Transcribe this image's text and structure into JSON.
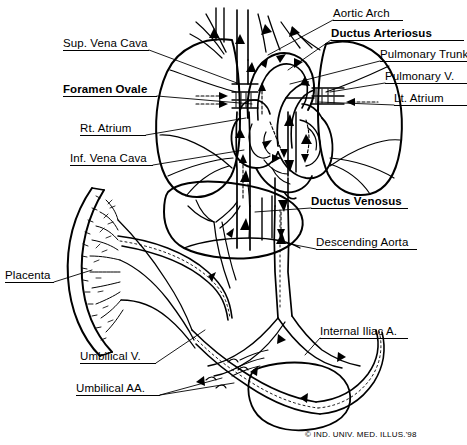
{
  "figure": {
    "credit": "© IND. UNIV. MED. ILLUS.'98",
    "artist_monogram": "C.M.B.",
    "line_color": "#000000",
    "background_color": "#ffffff"
  },
  "labels": [
    {
      "id": "aortic-arch",
      "text": "Aortic Arch",
      "bold": false,
      "x": 333,
      "y": 7,
      "underline_w": 70,
      "leader": [
        [
          333,
          20
        ],
        [
          268,
          55
        ]
      ]
    },
    {
      "id": "ductus-arteriosus",
      "text": "Ductus Arteriosus",
      "bold": true,
      "x": 331,
      "y": 27,
      "underline_w": 133,
      "leader": [
        [
          331,
          40
        ],
        [
          288,
          70
        ]
      ]
    },
    {
      "id": "pulmonary-trunk",
      "text": "Pulmonary Trunk",
      "bold": false,
      "x": 380,
      "y": 48,
      "underline_w": 87,
      "leader": [
        [
          380,
          61
        ],
        [
          290,
          84
        ]
      ]
    },
    {
      "id": "pulmonary-vein",
      "text": "Pulmonary V.",
      "bold": false,
      "x": 385,
      "y": 70,
      "underline_w": 82,
      "leader": [
        [
          385,
          83
        ],
        [
          330,
          92
        ]
      ]
    },
    {
      "id": "lt-atrium",
      "text": "Lt. Atrium",
      "bold": false,
      "x": 394,
      "y": 92,
      "underline_w": 73,
      "leader": [
        [
          394,
          105
        ],
        [
          318,
          102
        ]
      ]
    },
    {
      "id": "ductus-venosus",
      "text": "Ductus Venosus",
      "bold": true,
      "x": 311,
      "y": 195,
      "underline_w": 97,
      "leader": [
        [
          311,
          208
        ],
        [
          255,
          212
        ]
      ]
    },
    {
      "id": "descending-aorta",
      "text": "Descending Aorta",
      "bold": false,
      "x": 316,
      "y": 236,
      "underline_w": 101,
      "leader": [
        [
          316,
          249
        ],
        [
          285,
          243
        ]
      ]
    },
    {
      "id": "internal-iliac",
      "text": "Internal Iliac A.",
      "bold": false,
      "x": 320,
      "y": 325,
      "underline_w": 88,
      "leader": [
        [
          320,
          338
        ],
        [
          305,
          355
        ]
      ]
    },
    {
      "id": "sup-vena-cava",
      "text": "Sup. Vena Cava",
      "bold": false,
      "x": 63,
      "y": 37,
      "underline_w": 86,
      "leader": [
        [
          149,
          50
        ],
        [
          237,
          83
        ]
      ]
    },
    {
      "id": "foramen-ovale",
      "text": "Foramen Ovale",
      "bold": true,
      "x": 63,
      "y": 83,
      "underline_w": 94,
      "leader": [
        [
          157,
          96
        ],
        [
          252,
          104
        ]
      ]
    },
    {
      "id": "rt-atrium",
      "text": "Rt. Atrium",
      "bold": false,
      "x": 80,
      "y": 122,
      "underline_w": 66,
      "leader": [
        [
          146,
          135
        ],
        [
          246,
          118
        ]
      ]
    },
    {
      "id": "inf-vena-cava",
      "text": "Inf. Vena Cava",
      "bold": false,
      "x": 70,
      "y": 152,
      "underline_w": 83,
      "leader": [
        [
          153,
          165
        ],
        [
          244,
          150
        ]
      ]
    },
    {
      "id": "placenta",
      "text": "Placenta",
      "bold": false,
      "x": 5,
      "y": 269,
      "underline_w": 49,
      "leader": [
        [
          54,
          282
        ],
        [
          92,
          270
        ]
      ]
    },
    {
      "id": "umbilical-vein",
      "text": "Umbilical V.",
      "bold": false,
      "x": 80,
      "y": 350,
      "underline_w": 76,
      "leader": [
        [
          156,
          363
        ],
        [
          205,
          330
        ]
      ]
    },
    {
      "id": "umbilical-arteries",
      "text": "Umbilical AA.",
      "bold": false,
      "x": 76,
      "y": 382,
      "underline_w": 84,
      "leader": [
        [
          160,
          395
        ],
        [
          234,
          383
        ]
      ]
    }
  ],
  "anatomy": {
    "structures": [
      "placenta",
      "umbilical vein",
      "umbilical arteries",
      "liver",
      "ductus venosus",
      "inferior vena cava",
      "superior vena cava",
      "right atrium",
      "foramen ovale",
      "left atrium",
      "pulmonary trunk",
      "ductus arteriosus",
      "aortic arch",
      "descending aorta",
      "internal iliac artery",
      "urinary bladder",
      "right lung",
      "left lung"
    ],
    "flow_arrow_note": "Arrows indicate direction of fetal blood flow; dashed arrows indicate mixed/oxygenated shunt flow."
  }
}
